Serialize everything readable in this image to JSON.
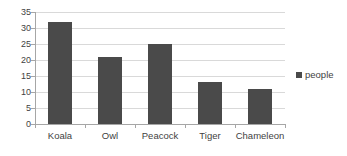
{
  "chart_data": {
    "type": "bar",
    "title": "",
    "subtitle": "",
    "xlabel": "",
    "ylabel": "",
    "categories": [
      "Koala",
      "Owl",
      "Peacock",
      "Tiger",
      "Chameleon"
    ],
    "series": [
      {
        "name": "people",
        "values": [
          32,
          21,
          25,
          13,
          11
        ],
        "color": "#4a4a4a"
      }
    ],
    "ylim": [
      0,
      35
    ],
    "ytick_step": 5,
    "yticks": [
      0,
      5,
      10,
      15,
      20,
      25,
      30,
      35
    ],
    "ytick_labels": [
      "0",
      "5",
      "10",
      "15",
      "20",
      "25",
      "30",
      "35"
    ],
    "grid": {
      "horizontal": true,
      "vertical": false,
      "color": "#d9d9d9"
    },
    "legend": {
      "position": "right",
      "entries": [
        {
          "label": "people",
          "color": "#4a4a4a",
          "marker": "square"
        }
      ]
    },
    "axis": {
      "line_color": "#a6a6a6",
      "tick_color": "#a6a6a6",
      "label_color": "#3f3f3f"
    },
    "background": "#ffffff"
  }
}
